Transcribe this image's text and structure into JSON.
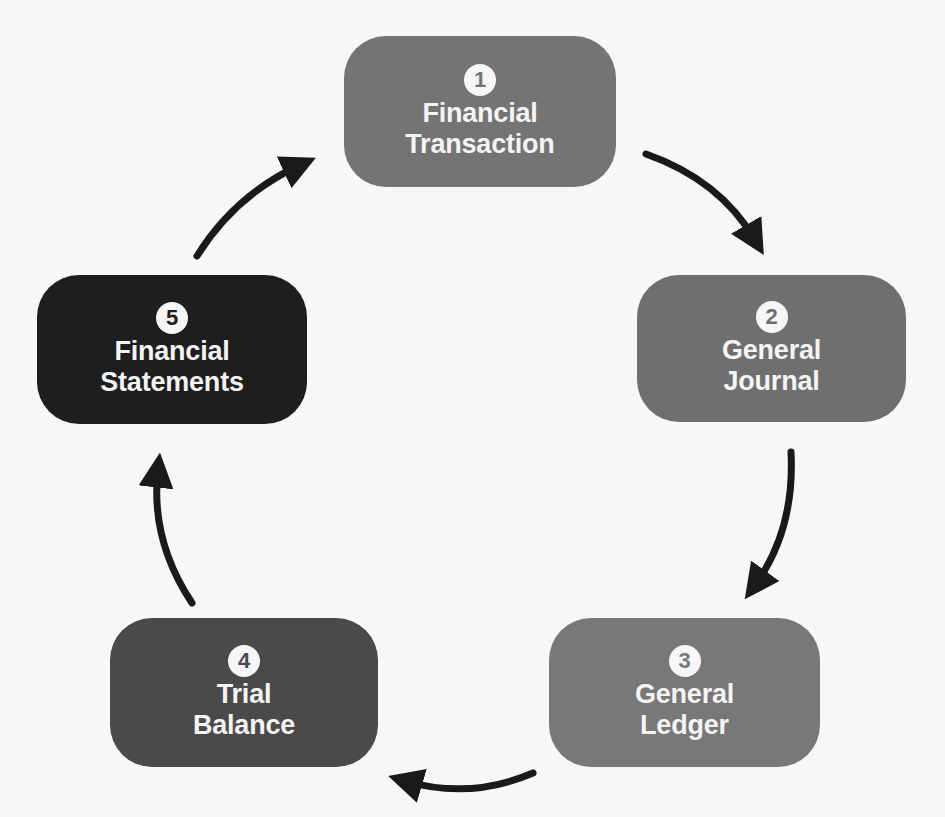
{
  "diagram": {
    "type": "cycle",
    "steps": [
      {
        "number": "1",
        "line1": "Financial",
        "line2": "Transaction",
        "color": "#747474",
        "badge_text_color": "#747474"
      },
      {
        "number": "2",
        "line1": "General",
        "line2": "Journal",
        "color": "#6f6f6f",
        "badge_text_color": "#6f6f6f"
      },
      {
        "number": "3",
        "line1": "General",
        "line2": "Ledger",
        "color": "#787878",
        "badge_text_color": "#787878"
      },
      {
        "number": "4",
        "line1": "Trial",
        "line2": "Balance",
        "color": "#4a4a4a",
        "badge_text_color": "#4a4a4a"
      },
      {
        "number": "5",
        "line1": "Financial",
        "line2": "Statements",
        "color": "#1e1e1e",
        "badge_text_color": "#1e1e1e"
      }
    ],
    "arrows": [
      {
        "from": "1",
        "to": "2"
      },
      {
        "from": "2",
        "to": "3"
      },
      {
        "from": "3",
        "to": "4"
      },
      {
        "from": "4",
        "to": "5"
      },
      {
        "from": "5",
        "to": "1"
      }
    ],
    "arrow_color": "#1a1a1a",
    "background": "#f7f7f7"
  }
}
